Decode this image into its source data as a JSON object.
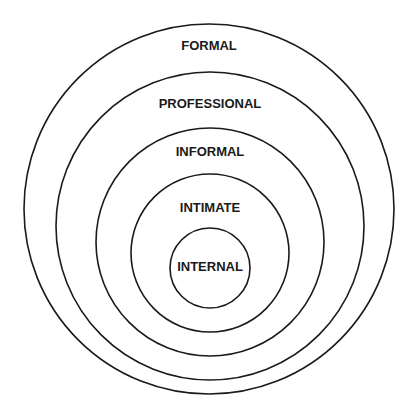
{
  "diagram": {
    "type": "concentric-circles",
    "line_color": "#1a1a1a",
    "background": "#ffffff",
    "rings": [
      {
        "label": "FORMAL",
        "cx": 209,
        "cy": 209,
        "r": 185,
        "label_y": 50
      },
      {
        "label": "PROFESSIONAL",
        "cx": 210,
        "cy": 226,
        "r": 154,
        "label_y": 108
      },
      {
        "label": "INFORMAL",
        "cx": 210,
        "cy": 242,
        "r": 114,
        "label_y": 156
      },
      {
        "label": "INTIMATE",
        "cx": 210,
        "cy": 253,
        "r": 79,
        "label_y": 212
      },
      {
        "label": "INTERNAL",
        "cx": 210,
        "cy": 268,
        "r": 40,
        "label_y": 271
      }
    ]
  }
}
